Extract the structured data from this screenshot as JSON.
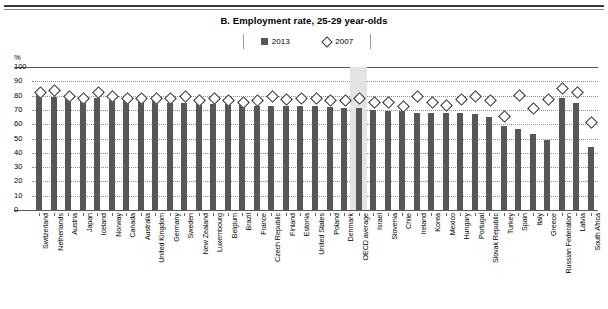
{
  "header": {
    "title": "B. Employment rate, 25-29 year-olds"
  },
  "legend": {
    "items": [
      {
        "label": "2013",
        "marker": "filled-square",
        "color": "#57575a"
      },
      {
        "label": "2007",
        "marker": "open-diamond",
        "color": "#ffffff"
      }
    ]
  },
  "axis": {
    "unit_label": "%",
    "yticks": [
      "100",
      "90",
      "80",
      "70",
      "60",
      "50",
      "40",
      "30",
      "20",
      "10",
      "0"
    ]
  },
  "chart_data": {
    "type": "bar",
    "title": "B. Employment rate, 25-29 year-olds",
    "xlabel": "",
    "ylabel": "%",
    "ylim": [
      0,
      100
    ],
    "ytick_step": 10,
    "grid": true,
    "legend_position": "top-center",
    "highlight_category": "OECD average",
    "categories": [
      "Switzerland",
      "Netherlands",
      "Austria",
      "Japan",
      "Iceland",
      "Norway",
      "Canada",
      "Australia",
      "United Kingdom",
      "Germany",
      "Sweden",
      "New Zealand",
      "Luxembourg",
      "Belgium",
      "Brazil",
      "France",
      "Czech Republic",
      "Finland",
      "Estonia",
      "United States",
      "Poland",
      "Denmark",
      "OECD average",
      "Israel",
      "Slovenia",
      "Chile",
      "Ireland",
      "Korea",
      "Mexico",
      "Hungary",
      "Portugal",
      "Slovak Republic",
      "Turkey",
      "Spain",
      "Italy",
      "Greece",
      "Russian Federation",
      "Latvia",
      "South Africa"
    ],
    "series": [
      {
        "name": "2013",
        "marker": "bar",
        "values": [
          82,
          79,
          78,
          78,
          78,
          77,
          76,
          76,
          76,
          75,
          75,
          74,
          74,
          74,
          74,
          73,
          73,
          73,
          73,
          73,
          72,
          71,
          71,
          70,
          69,
          69,
          68,
          68,
          68,
          68,
          67,
          65,
          59,
          57,
          53,
          49,
          78,
          75,
          44
        ]
      },
      {
        "name": "2007",
        "marker": "diamond",
        "values": [
          83,
          84,
          80,
          79,
          83,
          80,
          79,
          79,
          79,
          79,
          80,
          77,
          79,
          77,
          76,
          77,
          80,
          78,
          79,
          79,
          77,
          77,
          79,
          76,
          76,
          73,
          80,
          76,
          74,
          78,
          80,
          77,
          66,
          81,
          72,
          78,
          86,
          83,
          62
        ]
      }
    ]
  }
}
